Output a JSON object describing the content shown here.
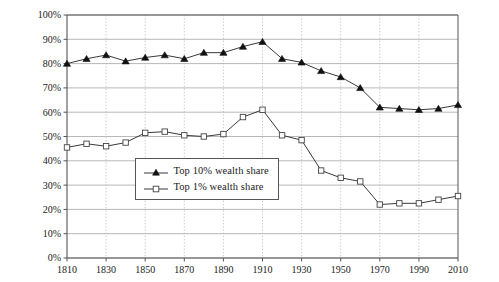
{
  "chart_data": {
    "type": "line",
    "title": "",
    "subtitle": "",
    "xlabel": "",
    "ylabel": "Share of top decile or percentile in total wealth",
    "xlim": [
      1810,
      2010
    ],
    "ylim": [
      0,
      100
    ],
    "y_tick_labels": [
      "0%",
      "10%",
      "20%",
      "30%",
      "40%",
      "50%",
      "60%",
      "70%",
      "80%",
      "90%",
      "100%"
    ],
    "y_ticks": [
      0,
      10,
      20,
      30,
      40,
      50,
      60,
      70,
      80,
      90,
      100
    ],
    "x_tick_labels": [
      "1810",
      "1830",
      "1850",
      "1870",
      "1890",
      "1910",
      "1930",
      "1950",
      "1970",
      "1990",
      "2010"
    ],
    "x_ticks": [
      1810,
      1830,
      1850,
      1870,
      1890,
      1910,
      1930,
      1950,
      1970,
      1990,
      2010
    ],
    "grid": "horizontal-solid-and-vertical-dotted",
    "legend_position": "center-left-inside",
    "x": [
      1810,
      1820,
      1830,
      1840,
      1850,
      1860,
      1870,
      1880,
      1890,
      1900,
      1910,
      1920,
      1930,
      1940,
      1950,
      1960,
      1970,
      1980,
      1990,
      2000,
      2010
    ],
    "series": [
      {
        "name": "Top 10% wealth share",
        "marker": "filled-triangle",
        "color": "#111111",
        "values": [
          80,
          82,
          83.5,
          81,
          82.5,
          83.5,
          82,
          84.5,
          84.5,
          87,
          89,
          82,
          80.5,
          77,
          74.5,
          70,
          62,
          61.5,
          61,
          61.5,
          63
        ]
      },
      {
        "name": "Top 1% wealth share",
        "marker": "open-square",
        "color": "#444444",
        "values": [
          45.5,
          47,
          46,
          47.5,
          51.5,
          52,
          50.5,
          50,
          51,
          58,
          61,
          50.5,
          48.5,
          36,
          33,
          31.5,
          22,
          22.5,
          22.5,
          24,
          25.5
        ]
      }
    ]
  },
  "legend": {
    "items": [
      {
        "label": "Top 10% wealth share",
        "marker": "filled-triangle"
      },
      {
        "label": "Top 1% wealth share",
        "marker": "open-square"
      }
    ]
  },
  "axis": {
    "y_title": "Share of top decile or percentile in total wealth"
  },
  "colors": {
    "series_top10": "#111111",
    "series_top1": "#444444",
    "grid_horizontal": "#9a9a9a",
    "grid_vertical": "#b4b4b4",
    "axis": "#555555",
    "background": "#ffffff",
    "text": "#1a1a1a"
  }
}
